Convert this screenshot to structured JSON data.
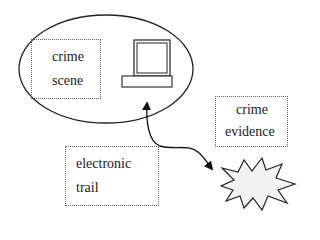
{
  "diagram": {
    "crime_scene": {
      "line1": "crime",
      "line2": "scene"
    },
    "crime_evidence": {
      "line1": "crime",
      "line2": "evidence"
    },
    "electronic_trail": {
      "line1": "electronic",
      "line2": "trail"
    },
    "icons": {
      "computer": "computer-icon",
      "explosion": "starburst-icon",
      "arrow": "double-headed-curved-arrow"
    },
    "colors": {
      "stroke": "#222222",
      "box_border": "#666666",
      "starburst_fill": "#f2f2f2",
      "background": "#ffffff"
    }
  }
}
